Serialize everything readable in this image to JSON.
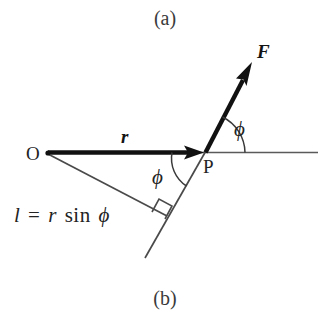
{
  "figure": {
    "title_top": "(a)",
    "title_bottom": "(b)",
    "background_color": "#ffffff",
    "stroke_color": "#232323",
    "bold_stroke_color": "#111111"
  },
  "points": {
    "origin_label": "O",
    "application_label": "P"
  },
  "vectors": {
    "position_label": "r",
    "force_label": "F"
  },
  "angles": {
    "upper_phi": "ϕ",
    "lower_phi": "ϕ"
  },
  "equation": {
    "lhs": "l",
    "equals": "=",
    "rhs_var": "r",
    "rhs_fn": "sin",
    "rhs_angle": "ϕ",
    "full": "l = r sin ϕ"
  },
  "markers": {
    "right_angle": "right-angle-square"
  },
  "geometry": {
    "origin": [
      48,
      154
    ],
    "application_point": [
      205,
      152
    ],
    "horizontal_line_end": [
      318,
      152
    ],
    "force_arrow_tip": [
      252,
      62
    ],
    "force_line_bottom": [
      145,
      258
    ],
    "perp_foot": [
      165,
      215
    ]
  }
}
